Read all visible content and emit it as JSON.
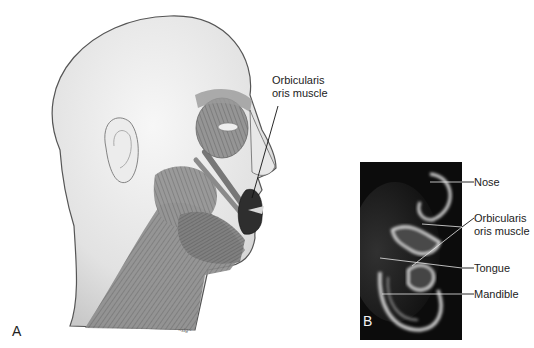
{
  "figure": {
    "panel_a": {
      "letter": "A",
      "description": "Lateral illustration of head and neck showing facial muscles",
      "labels": [
        {
          "text_line1": "Orbicularis",
          "text_line2": "oris muscle"
        }
      ],
      "signature": "artist signature"
    },
    "panel_b": {
      "letter": "B",
      "description": "Sagittal MRI of lower face",
      "labels": [
        {
          "text": "Nose"
        },
        {
          "text_line1": "Orbicularis",
          "text_line2": "oris muscle"
        },
        {
          "text": "Tongue"
        },
        {
          "text": "Mandible"
        }
      ]
    }
  },
  "colors": {
    "background": "#ffffff",
    "mri_background": "#0c0c0c",
    "skin": "#e4e4e4",
    "muscle": "#8a8a8a",
    "orbicularis": "#3a3a3a"
  }
}
